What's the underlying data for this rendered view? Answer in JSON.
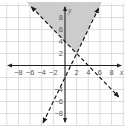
{
  "chart_data": {
    "type": "line",
    "title": "",
    "xlabel": "x",
    "ylabel": "y",
    "xlim": [
      -10,
      10
    ],
    "ylim": [
      -10,
      10
    ],
    "grid": true,
    "grid_step": 2,
    "x_tick_labels": [
      "-8",
      "-6",
      "-4",
      "-2",
      "2",
      "4",
      "6",
      "8"
    ],
    "y_tick_labels": [
      "8",
      "6",
      "4",
      "2",
      "-4",
      "-6",
      "-8"
    ],
    "series": [
      {
        "name": "boundary line 1",
        "equation": "y = 2x - 2",
        "style": "dashed",
        "slope": 2,
        "intercept": -2,
        "points": [
          [
            -3.75,
            -9.5
          ],
          [
            0,
            -2
          ],
          [
            1,
            0
          ],
          [
            2,
            2
          ],
          [
            5.75,
            9.5
          ]
        ]
      },
      {
        "name": "boundary line 2",
        "equation": "y = -x + 4",
        "style": "dashed",
        "slope": -1,
        "intercept": 4,
        "points": [
          [
            -5.75,
            9.75
          ],
          [
            0,
            4
          ],
          [
            2,
            2
          ],
          [
            4,
            0
          ],
          [
            9.2,
            -5.2
          ]
        ]
      }
    ],
    "shaded_region": {
      "description": "region above both dashed lines",
      "vertex": [
        2,
        2
      ],
      "color": "#c8c8c8"
    },
    "intersection": [
      2,
      2
    ]
  },
  "colors": {
    "background": "#ffffff",
    "grid": "#d6d6d6",
    "axes": "#222222",
    "lines": "#1a1a1a",
    "shade": "#c8c8c8",
    "labels": "#555555"
  },
  "labels": {
    "x_axis": "x",
    "y_axis": "y",
    "x_ticks": [
      {
        "text": "−8",
        "value": -8
      },
      {
        "text": "−6",
        "value": -6
      },
      {
        "text": "−4",
        "value": -4
      },
      {
        "text": "−2",
        "value": -2
      },
      {
        "text": "2",
        "value": 2
      },
      {
        "text": "4",
        "value": 4
      },
      {
        "text": "6",
        "value": 6
      },
      {
        "text": "8",
        "value": 8
      }
    ],
    "y_ticks": [
      {
        "text": "8",
        "value": 8
      },
      {
        "text": "6",
        "value": 6
      },
      {
        "text": "4",
        "value": 4
      },
      {
        "text": "2",
        "value": 2
      },
      {
        "text": "−4",
        "value": -4
      },
      {
        "text": "−6",
        "value": -6
      },
      {
        "text": "−8",
        "value": -8
      }
    ]
  }
}
